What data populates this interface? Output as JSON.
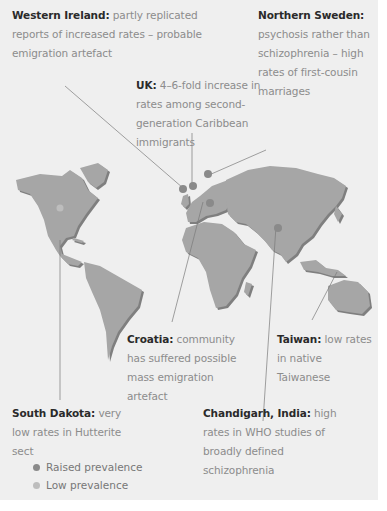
{
  "colors": {
    "background": "#efefef",
    "land": "#a6a6a6",
    "land_shadow": "#7f7f7f",
    "raised": "#8a8a8a",
    "low": "#bdbdbd",
    "leader_line": "#7a7a7a",
    "label_bold": "#2a2a2a",
    "label_text": "#8c8c8c"
  },
  "annotations": [
    {
      "id": "western-ireland",
      "title": "Western Ireland:",
      "text": "partly replicated reports of increased rates – probable emigration artefact",
      "prevalence": "raised"
    },
    {
      "id": "northern-sweden",
      "title": "Northern Sweden:",
      "text": "psychosis rather than schizophrenia – high rates of first-cousin marriages",
      "prevalence": "raised"
    },
    {
      "id": "uk",
      "title": "UK:",
      "text": "4–6-fold increase in rates among second-generation Caribbean immigrants",
      "prevalence": "raised"
    },
    {
      "id": "croatia",
      "title": "Croatia:",
      "text": "community has suffered possible mass emigration artefact",
      "prevalence": "raised"
    },
    {
      "id": "taiwan",
      "title": "Taiwan:",
      "text": "low rates in native Taiwanese",
      "prevalence": "low"
    },
    {
      "id": "south-dakota",
      "title": "South Dakota:",
      "text": "very low rates in Hutterite sect",
      "prevalence": "low"
    },
    {
      "id": "chandigarh",
      "title": "Chandigarh, India:",
      "text": "high rates in WHO studies of broadly defined schizophrenia",
      "prevalence": "raised"
    }
  ],
  "legend": {
    "items": [
      {
        "label": "Raised prevalence",
        "color": "#8a8a8a"
      },
      {
        "label": "Low prevalence",
        "color": "#bdbdbd"
      }
    ]
  }
}
